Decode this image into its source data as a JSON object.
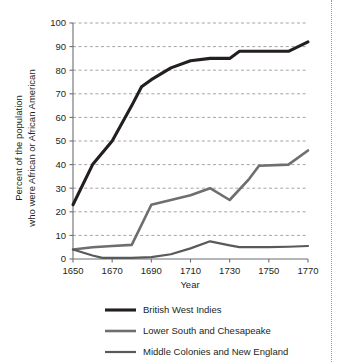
{
  "chart_data": {
    "type": "line",
    "title": "",
    "xlabel": "Year",
    "ylabel": "Percent of the population who were African or African American",
    "ylabel_line1": "Percent of the population",
    "ylabel_line2": "who were African or African American",
    "xlim": [
      1650,
      1770
    ],
    "ylim": [
      0,
      100
    ],
    "xticks": [
      1650,
      1670,
      1690,
      1710,
      1730,
      1750,
      1770
    ],
    "xtick_labels": [
      "1650",
      "1670",
      "1690",
      "1710",
      "1730",
      "1750",
      "1770"
    ],
    "yticks": [
      0,
      10,
      20,
      30,
      40,
      50,
      60,
      70,
      80,
      90,
      100
    ],
    "ytick_labels": [
      "0",
      "10",
      "20",
      "30",
      "40",
      "50",
      "60",
      "70",
      "80",
      "90",
      "100"
    ],
    "grid": "horizontal-dashed",
    "legend_position": "bottom",
    "series": [
      {
        "name": "British West Indies",
        "color": "#231f20",
        "width": 3.1,
        "x": [
          1650,
          1660,
          1670,
          1680,
          1685,
          1690,
          1700,
          1710,
          1720,
          1730,
          1735,
          1750,
          1760,
          1770
        ],
        "values": [
          23,
          40,
          50,
          65,
          73,
          76,
          81,
          84,
          85,
          85,
          88,
          88,
          88,
          92
        ]
      },
      {
        "name": "Lower South and Chesapeake",
        "color": "#6d6e71",
        "width": 2.6,
        "x": [
          1650,
          1660,
          1670,
          1680,
          1690,
          1700,
          1710,
          1720,
          1730,
          1740,
          1745,
          1760,
          1770
        ],
        "values": [
          4,
          5,
          5.5,
          6,
          23,
          25,
          27,
          30,
          25,
          34,
          39.5,
          40,
          46
        ]
      },
      {
        "name": "Middle Colonies and New England",
        "color": "#58595b",
        "width": 2.2,
        "x": [
          1650,
          1660,
          1665,
          1670,
          1680,
          1690,
          1700,
          1710,
          1720,
          1730,
          1735,
          1750,
          1760,
          1770
        ],
        "values": [
          4,
          1.5,
          0.5,
          0.5,
          0.5,
          0.8,
          2,
          4.5,
          7.5,
          5.8,
          5,
          5,
          5.2,
          5.5
        ]
      }
    ]
  },
  "legend": {
    "items": [
      {
        "label": "British West Indies"
      },
      {
        "label": "Lower South and Chesapeake"
      },
      {
        "label": "Middle Colonies and New England"
      }
    ]
  }
}
